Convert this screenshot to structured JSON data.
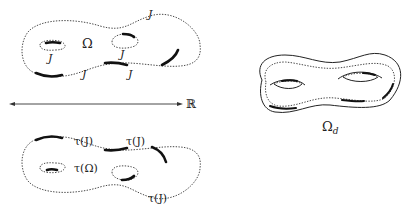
{
  "diagram": {
    "top_surface": {
      "region_label": "Ω",
      "boundary_labels": [
        "J",
        "J",
        "J",
        "J",
        "J"
      ]
    },
    "axis": {
      "label": "ℝ"
    },
    "bottom_surface": {
      "region_label": "τ(Ω)",
      "boundary_labels": [
        "τ(J)",
        "τ(J)",
        "τ(J)"
      ]
    },
    "double_surface": {
      "label_main": "Ω",
      "label_sub": "d"
    }
  }
}
